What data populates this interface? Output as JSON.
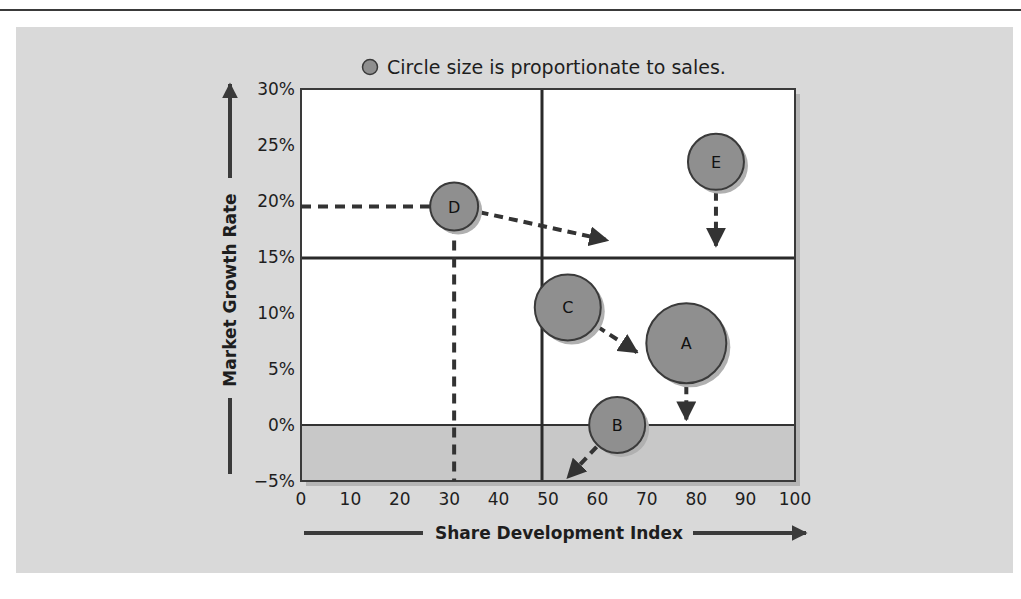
{
  "legend": {
    "text": "Circle size is proportionate to sales.",
    "icon": "circle-icon"
  },
  "colors": {
    "panel": "#d9d9d9",
    "plot": "#ffffff",
    "negative_band": "#c8c8c8",
    "bubble_fill": "#8f8f8f",
    "bubble_stroke": "#3a3a3a",
    "line": "#333333"
  },
  "chart_data": {
    "type": "scatter",
    "subtype": "bubble",
    "title": "",
    "note": "Circle size is proportionate to sales.",
    "xlabel": "Share Development Index",
    "ylabel": "Market Growth Rate",
    "xlim": [
      0,
      100
    ],
    "ylim": [
      -5,
      30
    ],
    "x_ticks": [
      "0",
      "10",
      "20",
      "30",
      "40",
      "50",
      "60",
      "70",
      "80",
      "90",
      "100"
    ],
    "y_ticks": [
      "30%",
      "25%",
      "20%",
      "15%",
      "10%",
      "5%",
      "0%",
      "−5%"
    ],
    "grid": false,
    "quadrant_lines": {
      "x": 50,
      "y": 15
    },
    "shaded_region": {
      "y_from": -5,
      "y_to": 0
    },
    "points": [
      {
        "label": "A",
        "x": 78,
        "y": 7.3,
        "relative_size": 40,
        "arrow_to": {
          "x": 78,
          "y": 0.5
        }
      },
      {
        "label": "B",
        "x": 64,
        "y": 0,
        "relative_size": 28,
        "arrow_to": {
          "x": 54,
          "y": -4.7
        }
      },
      {
        "label": "C",
        "x": 54,
        "y": 10.5,
        "relative_size": 33,
        "arrow_to": {
          "x": 68,
          "y": 6.5
        }
      },
      {
        "label": "D",
        "x": 31,
        "y": 19.5,
        "relative_size": 24,
        "arrow_to": {
          "x": 62,
          "y": 16.5
        }
      },
      {
        "label": "E",
        "x": 84,
        "y": 23.5,
        "relative_size": 28,
        "arrow_to": {
          "x": 84,
          "y": 16
        }
      }
    ],
    "reference_lines": [
      {
        "label": "D",
        "type": "dashed",
        "from": {
          "x": 0,
          "y": 19.5
        },
        "to": {
          "x": 31,
          "y": 19.5
        }
      },
      {
        "label": "D",
        "type": "dashed",
        "from": {
          "x": 31,
          "y": 19.5
        },
        "to": {
          "x": 31,
          "y": -5
        }
      }
    ]
  }
}
